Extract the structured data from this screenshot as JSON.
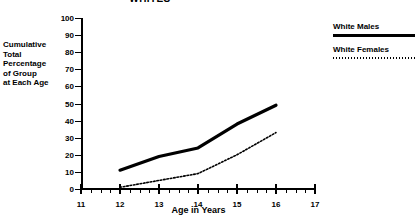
{
  "chart_data": {
    "type": "line",
    "title": "WHITES",
    "xlabel": "Age in Years",
    "ylabel": "Cumulative Total Percentage of Group at Each Age",
    "ylabel_lines": [
      "Cumulative",
      "Total",
      "Percentage",
      "of Group",
      "at Each Age"
    ],
    "x": [
      12,
      13,
      14,
      15,
      16
    ],
    "xlim": [
      11,
      17
    ],
    "ylim": [
      0,
      100
    ],
    "xticks": [
      11,
      12,
      13,
      14,
      15,
      16,
      17
    ],
    "yticks": [
      0,
      10,
      20,
      30,
      40,
      50,
      60,
      70,
      80,
      90,
      100
    ],
    "xtick_labels": [
      "11",
      "12",
      "13",
      "14",
      "15",
      "16",
      "17"
    ],
    "ytick_labels": [
      "0",
      "10",
      "20",
      "30",
      "40",
      "50",
      "60",
      "70",
      "80",
      "90",
      "100"
    ],
    "minor_xticks_per_interval": 3,
    "grid": false,
    "legend_position": "right",
    "series": [
      {
        "name": "White Males",
        "style": "solid",
        "color": "#000000",
        "width": 3.2,
        "values": [
          11,
          19,
          24,
          38,
          49
        ]
      },
      {
        "name": "White Females",
        "style": "dotted",
        "color": "#000000",
        "width": 1.6,
        "values": [
          1,
          5,
          9,
          20,
          33
        ]
      }
    ]
  },
  "legend": {
    "entries": [
      {
        "label": "White Males"
      },
      {
        "label": "White Females"
      }
    ]
  },
  "colors": {
    "background": "#ffffff",
    "ink": "#000000"
  }
}
